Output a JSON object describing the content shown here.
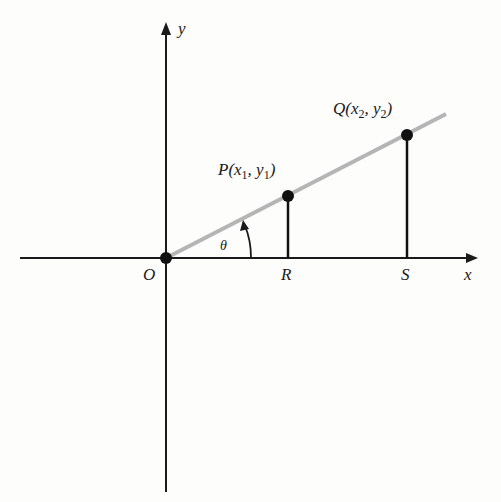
{
  "diagram": {
    "type": "coordinate-geometry",
    "axes": {
      "x_label": "x",
      "y_label": "y",
      "origin_label": "O"
    },
    "line": {
      "description": "line through origin at angle theta to x-axis",
      "color": "#b5b5b5"
    },
    "angle_label": "θ",
    "points": [
      {
        "name": "P",
        "label_main": "P(x",
        "sub1": "1",
        "mid": ", y",
        "sub2": "1",
        "close": ")",
        "foot_label": "R"
      },
      {
        "name": "Q",
        "label_main": "Q(x",
        "sub1": "2",
        "mid": ", y",
        "sub2": "2",
        "close": ")",
        "foot_label": "S"
      }
    ],
    "colors": {
      "axis": "#1a1a1a",
      "point": "#111111",
      "background": "#fdfdfb"
    }
  }
}
